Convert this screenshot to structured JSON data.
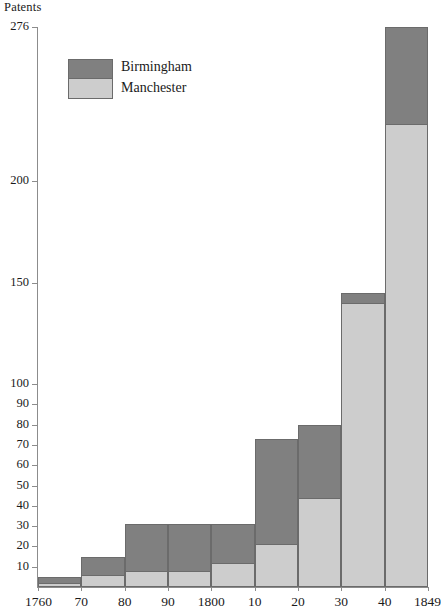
{
  "chart_data": {
    "type": "bar",
    "title": "",
    "ylabel": "Patents",
    "xlabel": "",
    "stacked": true,
    "grid": false,
    "legend_position": "top-left-inside",
    "categories": [
      "1760",
      "1770",
      "1780",
      "1790",
      "1800",
      "1810",
      "1820",
      "1830",
      "1840"
    ],
    "category_labels": [
      "1760",
      "70",
      "80",
      "90",
      "1800",
      "10",
      "20",
      "30",
      "40"
    ],
    "x_axis_end_label": "1849",
    "series": [
      {
        "name": "Manchester",
        "color": "#cdcdcd",
        "values": [
          2,
          6,
          8,
          8,
          12,
          21,
          44,
          140,
          228
        ]
      },
      {
        "name": "Birmingham",
        "color": "#808080",
        "values": [
          3,
          9,
          23,
          23,
          19,
          52,
          36,
          5,
          48
        ]
      }
    ],
    "totals": [
      5,
      15,
      31,
      31,
      31,
      73,
      80,
      145,
      276
    ],
    "ylim": [
      0,
      276
    ],
    "ytick_values": [
      10,
      20,
      30,
      40,
      50,
      60,
      70,
      80,
      90,
      100,
      150,
      200,
      276
    ],
    "ytick_labels": [
      "10",
      "20",
      "30",
      "40",
      "50",
      "60",
      "70",
      "80",
      "90",
      "100",
      "150",
      "200",
      "276"
    ]
  },
  "legend": {
    "entries": [
      {
        "label": "Birmingham"
      },
      {
        "label": "Manchester"
      }
    ]
  },
  "colors": {
    "birmingham": "#808080",
    "manchester": "#cdcdcd",
    "bar_outline": "#6b6b6b",
    "axis": "#8c8c8c",
    "text": "#1a1a1a",
    "background": "#ffffff"
  }
}
